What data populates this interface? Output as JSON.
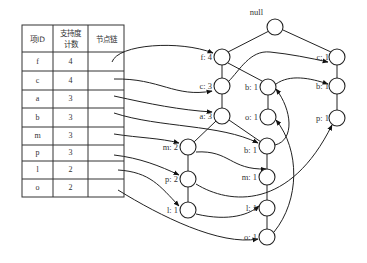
{
  "table": {
    "headers": {
      "item_id": "项ID",
      "support_line1": "支持度",
      "support_line2": "计数",
      "node_link": "节点链"
    },
    "rows": [
      {
        "item": "f",
        "count": "4"
      },
      {
        "item": "c",
        "count": "4"
      },
      {
        "item": "a",
        "count": "3"
      },
      {
        "item": "b",
        "count": "3"
      },
      {
        "item": "m",
        "count": "3"
      },
      {
        "item": "p",
        "count": "3"
      },
      {
        "item": "l",
        "count": "2"
      },
      {
        "item": "o",
        "count": "2"
      }
    ]
  },
  "tree": {
    "root": {
      "label": "null"
    },
    "nodes": {
      "f4": {
        "label": "f: 4"
      },
      "c3": {
        "label": "c: 3"
      },
      "a3": {
        "label": "a: 3"
      },
      "m2": {
        "label": "m: 2"
      },
      "p2": {
        "label": "p: 2"
      },
      "l1a": {
        "label": "l: 1"
      },
      "b1a": {
        "label": "b: 1"
      },
      "o1a": {
        "label": "o: 1"
      },
      "b1b": {
        "label": "b: 1"
      },
      "m1": {
        "label": "m: 1"
      },
      "l1b": {
        "label": "l: 1"
      },
      "o1b": {
        "label": "o: 1"
      },
      "c1": {
        "label": "c: 1"
      },
      "b1c": {
        "label": "b: 1"
      },
      "p1": {
        "label": "p: 1"
      }
    }
  }
}
